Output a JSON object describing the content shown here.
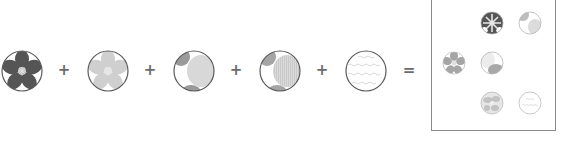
{
  "figure": {
    "operators": {
      "plus": "+",
      "equals": "="
    },
    "colors": {
      "dark_gray": "#555555",
      "mid_gray": "#8f8f8f",
      "light_gray": "#c8c8c8",
      "very_light_gray": "#dcdcdc",
      "outline": "#5a5a5a",
      "operator": "#6b6b6b",
      "background": "#ffffff"
    },
    "components": [
      {
        "id": "c1",
        "label": "dark-flower-layer",
        "style": "dark_flower"
      },
      {
        "id": "c2",
        "label": "light-flower-layer",
        "style": "light_flower"
      },
      {
        "id": "c3",
        "label": "blob-layer-solid",
        "style": "blobs_solid"
      },
      {
        "id": "c4",
        "label": "blob-layer-striped",
        "style": "blobs_striped"
      },
      {
        "id": "c5",
        "label": "text-texture-layer",
        "style": "text_texture"
      }
    ],
    "result_grid": {
      "patches": [
        {
          "row": 1,
          "col": 2,
          "style": "dark_flower"
        },
        {
          "row": 1,
          "col": 3,
          "style": "light_blobs"
        },
        {
          "row": 2,
          "col": 1,
          "style": "mid_flower"
        },
        {
          "row": 2,
          "col": 2,
          "style": "mid_blobs"
        },
        {
          "row": 3,
          "col": 2,
          "style": "light_flower"
        },
        {
          "row": 3,
          "col": 3,
          "style": "text_texture"
        }
      ]
    }
  }
}
